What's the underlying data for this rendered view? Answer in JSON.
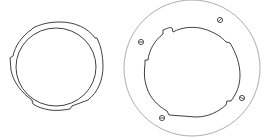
{
  "figure": {
    "stroke_color": "#2a2a2a",
    "light_stroke_color": "#8a8a8a",
    "background": "#ffffff"
  },
  "parts": [
    {
      "name": "left-ring",
      "type": "bayonet ring with notched outer edge",
      "outer_notches": 4,
      "inner_circle": true
    },
    {
      "name": "right-plate",
      "type": "circular mounting plate with notched central opening",
      "screw_holes": 4,
      "inner_notches": 4
    }
  ]
}
